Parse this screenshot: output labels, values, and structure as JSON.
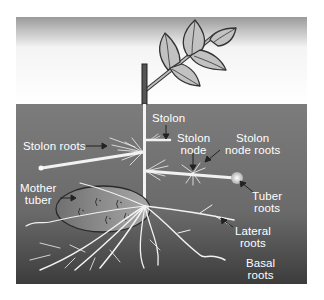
{
  "diagram": {
    "colors": {
      "sky_top": "#9a9a9a",
      "sky_bottom": "#ffffff",
      "soil_top": "#7a7a7a",
      "soil_bottom": "#3e3e3e",
      "leaf_fill": "#c2c2c2",
      "outline": "#333333",
      "root": "#f2f2f2",
      "tuber_fill": "#a8a8a8",
      "label_text": "#ffffff"
    },
    "labels": {
      "stolon": "Stolon",
      "stolon_node_line1": "Stolon",
      "stolon_node_line2": "node",
      "stolon_node_roots_line1": "Stolon",
      "stolon_node_roots_line2": "node roots",
      "stolon_roots": "Stolon roots",
      "mother_tuber_line1": "Mother",
      "mother_tuber_line2": "tuber",
      "tuber_roots_line1": "Tuber",
      "tuber_roots_line2": "roots",
      "lateral_roots_line1": "Lateral",
      "lateral_roots_line2": "roots",
      "basal_roots_line1": "Basal",
      "basal_roots_line2": "roots"
    }
  }
}
